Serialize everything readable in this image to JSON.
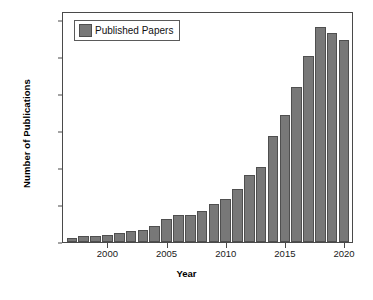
{
  "chart_data": {
    "type": "bar",
    "title": "",
    "xlabel": "Year",
    "ylabel": "Number of Publications",
    "ylim": [
      0,
      1250
    ],
    "yticks": [
      0,
      200,
      400,
      600,
      800,
      1000,
      1200
    ],
    "ytick_labels": [
      "0",
      "200",
      "400",
      "600",
      "800",
      "1000",
      "1200"
    ],
    "xticks": [
      2000,
      2005,
      2010,
      2015,
      2020
    ],
    "xtick_labels": [
      "2000",
      "2005",
      "2010",
      "2015",
      "2020"
    ],
    "grid": false,
    "legend": {
      "position": "top-left",
      "entries": [
        {
          "label": "Published Papers",
          "color": "#787878"
        }
      ]
    },
    "categories": [
      1997,
      1998,
      1999,
      2000,
      2001,
      2002,
      2003,
      2004,
      2005,
      2006,
      2007,
      2008,
      2009,
      2010,
      2011,
      2012,
      2013,
      2014,
      2015,
      2016,
      2017,
      2018,
      2019,
      2020
    ],
    "series": [
      {
        "name": "Published Papers",
        "color": "#787878",
        "values": [
          22,
          32,
          32,
          36,
          48,
          58,
          64,
          88,
          122,
          145,
          148,
          170,
          208,
          232,
          285,
          362,
          408,
          572,
          690,
          840,
          1005,
          1165,
          1130,
          1095
        ]
      }
    ]
  },
  "axes": {
    "y_title": "Number of Publications",
    "x_title": "Year"
  },
  "colors": {
    "bar_fill": "#787878",
    "bar_stroke": "#4f4f4f",
    "frame": "#4a4a4a",
    "text": "#111111",
    "background": "#ffffff"
  }
}
